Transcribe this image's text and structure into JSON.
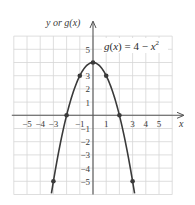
{
  "chart_data": {
    "type": "line",
    "title": "",
    "function_label": "g(x) = 4 − x²",
    "function_label_parts": {
      "lhs": "g(x) = 4 − x",
      "exp": "2"
    },
    "xlabel": "x",
    "ylabel": "y or g(x)",
    "xlim": [
      -6,
      6
    ],
    "ylim": [
      -6,
      6
    ],
    "grid": true,
    "x_ticks": [
      -5,
      -4,
      -3,
      -1,
      1,
      3,
      4,
      5
    ],
    "x_tick_labels": [
      "−5",
      "−4",
      "−3",
      "−1",
      "1",
      "3",
      "4",
      "5"
    ],
    "y_ticks": [
      5,
      3,
      2,
      1,
      -1,
      -2,
      -3,
      -4,
      -5
    ],
    "y_tick_labels": [
      "5",
      "3",
      "2",
      "1",
      "−1",
      "−2",
      "−3",
      "−4",
      "−5"
    ],
    "series": [
      {
        "name": "g(x) = 4 − x²",
        "curve": "4 - x^2",
        "domain": [
          -3.15,
          3.15
        ],
        "points": [
          {
            "x": -3,
            "y": -5
          },
          {
            "x": -2,
            "y": 0
          },
          {
            "x": -1,
            "y": 3
          },
          {
            "x": 0,
            "y": 4
          },
          {
            "x": 1,
            "y": 3
          },
          {
            "x": 2,
            "y": 0
          },
          {
            "x": 3,
            "y": -5
          }
        ]
      }
    ],
    "colors": {
      "curve": "#3a3a3a",
      "grid": "#d6d6d6",
      "axis": "#555555",
      "label_box": "#ffffff"
    }
  }
}
